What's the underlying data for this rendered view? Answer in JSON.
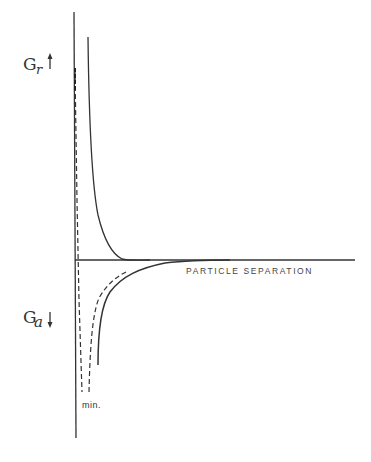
{
  "diagram": {
    "type": "potential-energy-curves",
    "labels": {
      "repulsive": "G",
      "repulsive_sub": "r",
      "attractive": "G",
      "attractive_sub": "a",
      "x_axis": "PARTICLE SEPARATION",
      "minimum": "min."
    },
    "arrows": {
      "repulsive": "up-arrow",
      "attractive": "down-arrow"
    },
    "colors": {
      "line": "#333333",
      "background": "#ffffff"
    },
    "curves": [
      {
        "name": "repulsive-energy-curve",
        "style": "solid"
      },
      {
        "name": "attractive-energy-curve",
        "style": "solid"
      },
      {
        "name": "net-energy-curve",
        "style": "dashed"
      }
    ]
  }
}
